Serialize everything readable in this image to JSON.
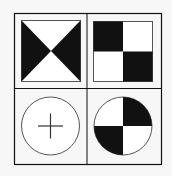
{
  "diagram": {
    "title": "",
    "colors": {
      "background": "#f7f7f7",
      "ink": "#111111",
      "thin_line": "#555555",
      "white": "#ffffff"
    },
    "grid": {
      "rows": 2,
      "cols": 2
    },
    "cells": [
      {
        "position": "top-left",
        "shape": "square",
        "pattern": "hourglass-left-right-triangles-black"
      },
      {
        "position": "top-right",
        "shape": "square",
        "pattern": "checkerboard-2x2-top-left-bottom-right-black"
      },
      {
        "position": "bottom-left",
        "shape": "circle",
        "pattern": "plus-crosshair"
      },
      {
        "position": "bottom-right",
        "shape": "circle",
        "pattern": "quadrants-top-right-bottom-left-black"
      }
    ]
  }
}
